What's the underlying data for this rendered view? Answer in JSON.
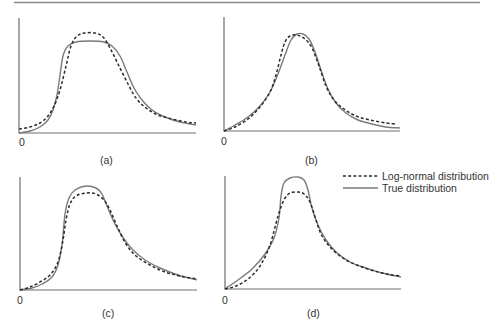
{
  "chart_data": {
    "type": "line",
    "title": "",
    "legend": {
      "position": "right, between rows",
      "entries": [
        {
          "label": "Log-normal distribution",
          "style": "dashed",
          "color": "#2b2b2b"
        },
        {
          "label": "True distribution",
          "style": "solid",
          "color": "#7a7a7a"
        }
      ]
    },
    "grid": false,
    "panels": [
      {
        "id": "a",
        "label": "(a)",
        "origin_label": "0",
        "xlabel": "",
        "ylabel": "",
        "axes": {
          "x0": 19,
          "y0": 133,
          "x1": 196,
          "ytop": 18
        },
        "series": [
          {
            "name": "True distribution",
            "points": [
              [
                19,
                133
              ],
              [
                30,
                131
              ],
              [
                40,
                127
              ],
              [
                48,
                120
              ],
              [
                53,
                110
              ],
              [
                57,
                95
              ],
              [
                60,
                75
              ],
              [
                63,
                56
              ],
              [
                68,
                46
              ],
              [
                76,
                42
              ],
              [
                90,
                41
              ],
              [
                104,
                42
              ],
              [
                112,
                46
              ],
              [
                120,
                56
              ],
              [
                127,
                72
              ],
              [
                134,
                88
              ],
              [
                142,
                100
              ],
              [
                152,
                110
              ],
              [
                165,
                117
              ],
              [
                180,
                122
              ],
              [
                196,
                125
              ]
            ]
          },
          {
            "name": "Log-normal distribution",
            "points": [
              [
                19,
                129
              ],
              [
                30,
                127
              ],
              [
                40,
                123
              ],
              [
                48,
                116
              ],
              [
                54,
                106
              ],
              [
                60,
                90
              ],
              [
                66,
                66
              ],
              [
                71,
                46
              ],
              [
                77,
                36
              ],
              [
                85,
                33
              ],
              [
                95,
                33
              ],
              [
                103,
                37
              ],
              [
                110,
                48
              ],
              [
                118,
                64
              ],
              [
                127,
                82
              ],
              [
                136,
                98
              ],
              [
                146,
                108
              ],
              [
                158,
                115
              ],
              [
                172,
                119
              ],
              [
                186,
                122
              ],
              [
                196,
                123
              ]
            ]
          }
        ]
      },
      {
        "id": "b",
        "label": "(b)",
        "origin_label": "0",
        "xlabel": "",
        "ylabel": "",
        "axes": {
          "x0": 224,
          "y0": 131,
          "x1": 400,
          "ytop": 17
        },
        "series": [
          {
            "name": "True distribution",
            "points": [
              [
                224,
                131
              ],
              [
                235,
                125
              ],
              [
                248,
                117
              ],
              [
                260,
                106
              ],
              [
                270,
                92
              ],
              [
                278,
                74
              ],
              [
                285,
                55
              ],
              [
                291,
                40
              ],
              [
                297,
                34
              ],
              [
                303,
                34
              ],
              [
                309,
                39
              ],
              [
                315,
                52
              ],
              [
                321,
                70
              ],
              [
                328,
                89
              ],
              [
                336,
                103
              ],
              [
                346,
                113
              ],
              [
                358,
                120
              ],
              [
                372,
                124
              ],
              [
                386,
                127
              ],
              [
                400,
                128
              ]
            ]
          },
          {
            "name": "Log-normal distribution",
            "points": [
              [
                224,
                131
              ],
              [
                235,
                127
              ],
              [
                248,
                119
              ],
              [
                260,
                107
              ],
              [
                270,
                92
              ],
              [
                276,
                75
              ],
              [
                281,
                55
              ],
              [
                285,
                42
              ],
              [
                290,
                36
              ],
              [
                297,
                35
              ],
              [
                305,
                39
              ],
              [
                312,
                48
              ],
              [
                319,
                66
              ],
              [
                326,
                86
              ],
              [
                334,
                100
              ],
              [
                344,
                109
              ],
              [
                356,
                116
              ],
              [
                370,
                120
              ],
              [
                386,
                123
              ],
              [
                396,
                124
              ]
            ]
          }
        ]
      },
      {
        "id": "c",
        "label": "(c)",
        "origin_label": "0",
        "xlabel": "",
        "ylabel": "",
        "axes": {
          "x0": 20,
          "y0": 290,
          "x1": 197,
          "ytop": 177
        },
        "series": [
          {
            "name": "True distribution",
            "points": [
              [
                20,
                290
              ],
              [
                32,
                288
              ],
              [
                42,
                284
              ],
              [
                52,
                277
              ],
              [
                58,
                265
              ],
              [
                62,
                245
              ],
              [
                65,
                214
              ],
              [
                69,
                198
              ],
              [
                75,
                190
              ],
              [
                86,
                186
              ],
              [
                96,
                188
              ],
              [
                102,
                194
              ],
              [
                107,
                206
              ],
              [
                114,
                222
              ],
              [
                122,
                236
              ],
              [
                132,
                249
              ],
              [
                145,
                260
              ],
              [
                160,
                268
              ],
              [
                178,
                275
              ],
              [
                197,
                280
              ]
            ]
          },
          {
            "name": "Log-normal distribution",
            "points": [
              [
                20,
                290
              ],
              [
                30,
                287
              ],
              [
                40,
                282
              ],
              [
                50,
                275
              ],
              [
                58,
                262
              ],
              [
                63,
                240
              ],
              [
                66,
                220
              ],
              [
                70,
                204
              ],
              [
                76,
                196
              ],
              [
                86,
                193
              ],
              [
                96,
                194
              ],
              [
                104,
                200
              ],
              [
                110,
                210
              ],
              [
                117,
                226
              ],
              [
                126,
                244
              ],
              [
                136,
                256
              ],
              [
                150,
                265
              ],
              [
                165,
                272
              ],
              [
                180,
                276
              ],
              [
                197,
                279
              ]
            ]
          }
        ]
      },
      {
        "id": "d",
        "label": "(d)",
        "origin_label": "0",
        "xlabel": "",
        "ylabel": "",
        "axes": {
          "x0": 225,
          "y0": 289,
          "x1": 401,
          "ytop": 176
        },
        "series": [
          {
            "name": "True distribution",
            "points": [
              [
                225,
                289
              ],
              [
                238,
                280
              ],
              [
                252,
                269
              ],
              [
                265,
                254
              ],
              [
                274,
                238
              ],
              [
                279,
                218
              ],
              [
                281,
                196
              ],
              [
                284,
                183
              ],
              [
                290,
                178
              ],
              [
                298,
                177
              ],
              [
                304,
                180
              ],
              [
                308,
                190
              ],
              [
                312,
                208
              ],
              [
                318,
                225
              ],
              [
                326,
                240
              ],
              [
                336,
                252
              ],
              [
                350,
                262
              ],
              [
                366,
                268
              ],
              [
                382,
                273
              ],
              [
                401,
                277
              ]
            ]
          },
          {
            "name": "Log-normal distribution",
            "points": [
              [
                225,
                289
              ],
              [
                236,
                286
              ],
              [
                248,
                279
              ],
              [
                260,
                266
              ],
              [
                270,
                245
              ],
              [
                278,
                216
              ],
              [
                284,
                200
              ],
              [
                290,
                193
              ],
              [
                298,
                192
              ],
              [
                304,
                194
              ],
              [
                310,
                202
              ],
              [
                316,
                220
              ],
              [
                322,
                236
              ],
              [
                332,
                249
              ],
              [
                346,
                260
              ],
              [
                362,
                267
              ],
              [
                378,
                272
              ],
              [
                392,
                275
              ],
              [
                401,
                276
              ]
            ]
          }
        ]
      }
    ]
  },
  "figure": {
    "panels": [
      {
        "label": "(a)",
        "origin": "0"
      },
      {
        "label": "(b)",
        "origin": "0"
      },
      {
        "label": "(c)",
        "origin": "0"
      },
      {
        "label": "(d)",
        "origin": "0"
      }
    ],
    "legend": {
      "lognormal_label": "Log-normal distribution",
      "true_label": "True distribution"
    }
  }
}
